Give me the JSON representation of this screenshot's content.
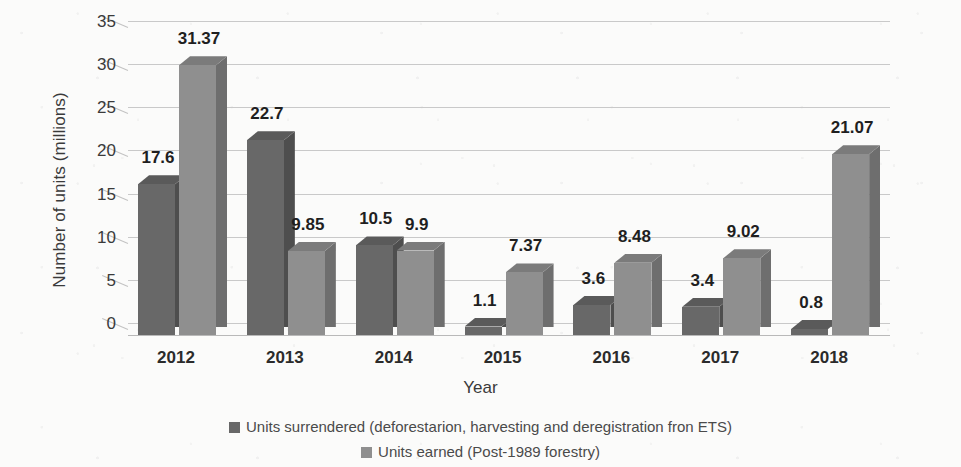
{
  "chart_data": {
    "type": "bar",
    "title": "",
    "xlabel": "Year",
    "ylabel": "Number of units (millions)",
    "categories": [
      "2012",
      "2013",
      "2014",
      "2015",
      "2016",
      "2017",
      "2018"
    ],
    "series": [
      {
        "name": "Units surrendered (deforestarion, harvesting and deregistration fron ETS)",
        "color": "#686868",
        "values": [
          17.6,
          22.7,
          10.5,
          1.1,
          3.6,
          3.4,
          0.8
        ]
      },
      {
        "name": "Units earned (Post-1989 forestry)",
        "color": "#8f8f8f",
        "values": [
          31.37,
          9.85,
          9.9,
          7.37,
          8.48,
          9.02,
          21.07
        ]
      }
    ],
    "ylim": [
      0,
      35
    ],
    "yticks": [
      "0",
      "5",
      "10",
      "15",
      "20",
      "25",
      "30",
      "35"
    ],
    "grid": true,
    "legend_position": "bottom",
    "data_labels": [
      [
        "17.6",
        "31.37"
      ],
      [
        "22.7",
        "9.85"
      ],
      [
        "10.5",
        "9.9"
      ],
      [
        "1.1",
        "7.37"
      ],
      [
        "3.6",
        "8.48"
      ],
      [
        "3.4",
        "9.02"
      ],
      [
        "0.8",
        "21.07"
      ]
    ]
  }
}
